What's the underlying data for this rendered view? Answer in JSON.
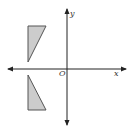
{
  "diagram": {
    "type": "coordinate-plane",
    "axes": {
      "x_label": "x",
      "y_label": "y",
      "origin_label": "O",
      "x_axis": {
        "y": 69,
        "x_start": 8,
        "x_end": 126
      },
      "y_axis": {
        "x": 67,
        "y_start": 9,
        "y_end": 125
      }
    },
    "shapes": [
      {
        "name": "upper-triangle",
        "quadrant": "II",
        "points": "28,26 46,26 28,62",
        "fill": "#cccccc",
        "stroke": "#555555"
      },
      {
        "name": "lower-triangle",
        "quadrant": "III",
        "points": "28,75 28,110 46,110",
        "fill": "#cccccc",
        "stroke": "#555555"
      }
    ],
    "colors": {
      "axis": "#222222",
      "shape_fill": "#cccccc",
      "shape_stroke": "#555555",
      "background": "#ffffff"
    }
  }
}
